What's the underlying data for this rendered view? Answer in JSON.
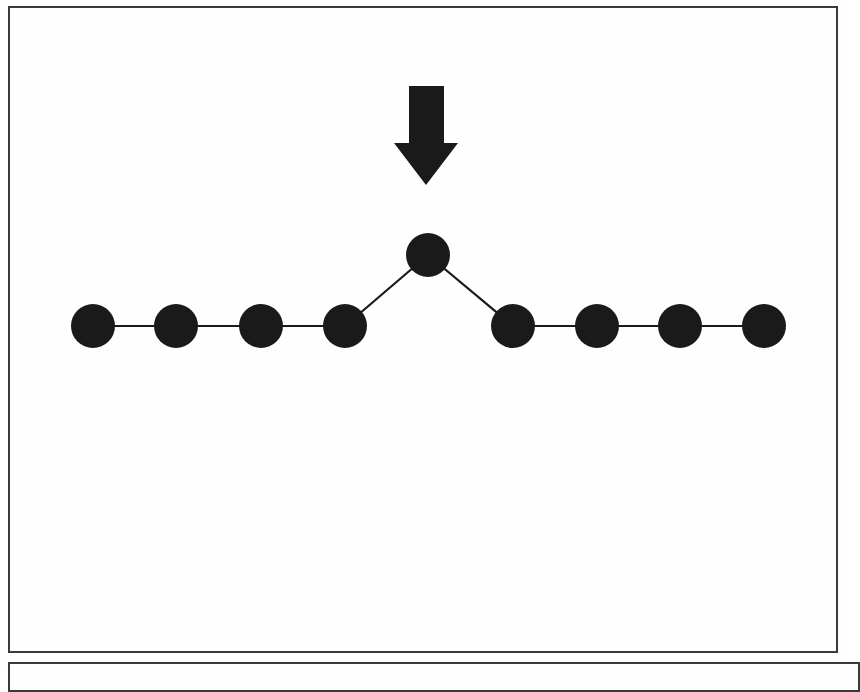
{
  "page": {
    "background_color": "#fdfdfd",
    "ink_color": "#1a1a1a",
    "border_color": "#3a3a3a",
    "width": 848,
    "height": 672
  },
  "figure_panel": {
    "name": "figure-frame",
    "x": 8,
    "y": 6,
    "width": 830,
    "height": 647,
    "border_color": "#3a3a3a",
    "border_width": 2
  },
  "lower_panel": {
    "name": "lower-frame",
    "x": 8,
    "y": 662,
    "width": 852,
    "height": 30,
    "border_color": "#3a3a3a",
    "border_width": 2
  },
  "chart_data": {
    "type": "diagram",
    "subtype": "node-link-graph",
    "title": "",
    "xlabel": "",
    "ylabel": "",
    "grid": false,
    "legend": null,
    "node_color": "#1a1a1a",
    "edge_color": "#1a1a1a",
    "node_radius": 22,
    "edge_width": 2.2,
    "nodes": [
      {
        "id": "n1",
        "label": "",
        "x": 93,
        "y": 326,
        "r": 22
      },
      {
        "id": "n2",
        "label": "",
        "x": 176,
        "y": 326,
        "r": 22
      },
      {
        "id": "n3",
        "label": "",
        "x": 261,
        "y": 326,
        "r": 22
      },
      {
        "id": "n4",
        "label": "",
        "x": 345,
        "y": 326,
        "r": 22
      },
      {
        "id": "n5",
        "label": "",
        "x": 428,
        "y": 255,
        "r": 22
      },
      {
        "id": "n6",
        "label": "",
        "x": 513,
        "y": 326,
        "r": 22
      },
      {
        "id": "n7",
        "label": "",
        "x": 597,
        "y": 326,
        "r": 22
      },
      {
        "id": "n8",
        "label": "",
        "x": 680,
        "y": 326,
        "r": 22
      },
      {
        "id": "n9",
        "label": "",
        "x": 764,
        "y": 326,
        "r": 22
      }
    ],
    "edges": [
      {
        "from": "n1",
        "to": "n2"
      },
      {
        "from": "n2",
        "to": "n3"
      },
      {
        "from": "n3",
        "to": "n4"
      },
      {
        "from": "n4",
        "to": "n5"
      },
      {
        "from": "n5",
        "to": "n6"
      },
      {
        "from": "n6",
        "to": "n7"
      },
      {
        "from": "n7",
        "to": "n8"
      },
      {
        "from": "n8",
        "to": "n9"
      }
    ],
    "annotations": [
      {
        "type": "arrow",
        "name": "down-arrow-annotation",
        "direction": "down",
        "points_to_node": "n5",
        "color": "#1a1a1a",
        "shaft": {
          "left": 409,
          "right": 444,
          "top": 86,
          "bottom": 144
        },
        "head": {
          "left": 394,
          "right": 458,
          "top": 143,
          "tip_x": 426,
          "tip_y": 185
        }
      }
    ]
  }
}
